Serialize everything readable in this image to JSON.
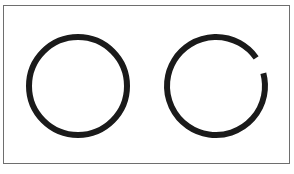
{
  "figure": {
    "frame_color": "#6e6e6e",
    "stroke_color": "#1a1a1a",
    "shapes": [
      {
        "name": "closed-circle",
        "cx": 78,
        "cy": 86,
        "r": 49,
        "stroke_width": 6
      },
      {
        "name": "open-circle",
        "cx": 216,
        "cy": 86,
        "r": 49,
        "stroke_width": 6,
        "gap_start_deg": 55,
        "gap_end_deg": 75
      }
    ]
  }
}
